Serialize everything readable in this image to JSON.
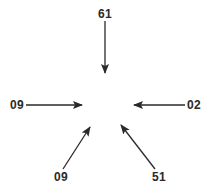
{
  "diagram": {
    "width": 210,
    "height": 193,
    "background": "#ffffff",
    "stroke_color": "#2a2a2a",
    "center_region": {
      "x": 106,
      "y": 108
    },
    "arrows": [
      {
        "id": "top",
        "label": "61",
        "label_pos": {
          "x": 105,
          "y": 14
        },
        "from": {
          "x": 105,
          "y": 21
        },
        "to": {
          "x": 105,
          "y": 73
        }
      },
      {
        "id": "left",
        "label": "09",
        "label_pos": {
          "x": 17,
          "y": 105
        },
        "from": {
          "x": 26,
          "y": 105
        },
        "to": {
          "x": 82,
          "y": 105
        }
      },
      {
        "id": "right",
        "label": "02",
        "label_pos": {
          "x": 194,
          "y": 105
        },
        "from": {
          "x": 185,
          "y": 105
        },
        "to": {
          "x": 134,
          "y": 105
        }
      },
      {
        "id": "bottom-left",
        "label": "09",
        "label_pos": {
          "x": 61,
          "y": 177
        },
        "from": {
          "x": 63,
          "y": 169
        },
        "to": {
          "x": 90,
          "y": 127
        }
      },
      {
        "id": "bottom-right",
        "label": "51",
        "label_pos": {
          "x": 159,
          "y": 177
        },
        "from": {
          "x": 155,
          "y": 169
        },
        "to": {
          "x": 121,
          "y": 125
        }
      }
    ]
  }
}
